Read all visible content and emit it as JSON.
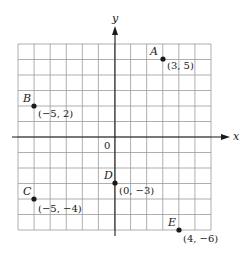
{
  "diagram": {
    "type": "coordinate-plane",
    "x_axis_label": "x",
    "y_axis_label": "y",
    "origin_label": "0",
    "x_range": [
      -6,
      6
    ],
    "y_range": [
      -6,
      6
    ],
    "grid": true,
    "colors": {
      "grid": "#9a9a9a",
      "axis": "#1a1a1a",
      "point": "#1a1a1a",
      "background": "#ffffff"
    }
  },
  "points": [
    {
      "name": "A",
      "x": 3,
      "y": 5,
      "coord_label": "(3, 5)"
    },
    {
      "name": "B",
      "x": -5,
      "y": 2,
      "coord_label": "(−5, 2)"
    },
    {
      "name": "C",
      "x": -5,
      "y": -4,
      "coord_label": "(−5, −4)"
    },
    {
      "name": "D",
      "x": 0,
      "y": -3,
      "coord_label": "(0, −3)"
    },
    {
      "name": "E",
      "x": 4,
      "y": -6,
      "coord_label": "(4, −6)"
    }
  ]
}
